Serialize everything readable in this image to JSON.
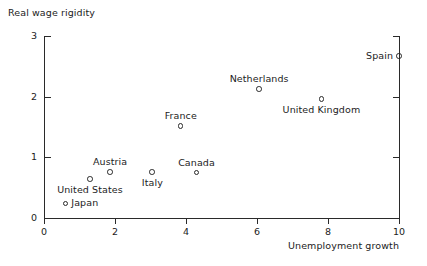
{
  "chart_data": {
    "type": "scatter",
    "title": "",
    "xlabel": "Unemployment growth",
    "ylabel": "Real wage rigidity",
    "xlim": [
      0,
      10
    ],
    "ylim": [
      0,
      3
    ],
    "xticks": [
      "0",
      "2",
      "4",
      "6",
      "8",
      "10"
    ],
    "xtick_values": [
      0,
      2,
      4,
      6,
      8,
      10
    ],
    "yticks": [
      "0",
      "1",
      "2",
      "3"
    ],
    "ytick_values": [
      0,
      1,
      2,
      3
    ],
    "grid": false,
    "legend": "none",
    "marker_style": "open-circle",
    "points": [
      {
        "label": "Japan",
        "x": 0.6,
        "y": 0.24,
        "label_pos": "right"
      },
      {
        "label": "United States",
        "x": 1.3,
        "y": 0.64,
        "label_pos": "below"
      },
      {
        "label": "Austria",
        "x": 1.86,
        "y": 0.76,
        "label_pos": "above"
      },
      {
        "label": "Italy",
        "x": 3.05,
        "y": 0.76,
        "label_pos": "below"
      },
      {
        "label": "France",
        "x": 3.85,
        "y": 1.52,
        "label_pos": "above"
      },
      {
        "label": "Canada",
        "x": 4.3,
        "y": 0.75,
        "label_pos": "above"
      },
      {
        "label": "Netherlands",
        "x": 6.06,
        "y": 2.13,
        "label_pos": "above"
      },
      {
        "label": "United Kingdom",
        "x": 7.82,
        "y": 1.96,
        "label_pos": "below"
      },
      {
        "label": "Spain",
        "x": 10.0,
        "y": 2.67,
        "label_pos": "left"
      }
    ]
  },
  "style": {
    "axis_color": "#2a2a2a",
    "text_color": "#1c1c1c",
    "background": "#ffffff"
  }
}
